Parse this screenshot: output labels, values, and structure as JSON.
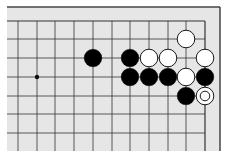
{
  "board": {
    "background": "#e6e6e6",
    "line_color": "#333333",
    "x_lines": [
      18,
      37,
      55,
      74,
      93,
      112,
      130,
      149,
      168,
      186,
      205
    ],
    "y_lines": [
      21,
      39,
      58,
      77,
      96,
      114,
      133
    ],
    "edge_right": true,
    "edge_top": true,
    "star_points": [
      [
        1,
        3
      ]
    ],
    "stones": [
      {
        "col": 9,
        "row": 1,
        "color": "white"
      },
      {
        "col": 4,
        "row": 2,
        "color": "black"
      },
      {
        "col": 6,
        "row": 2,
        "color": "black"
      },
      {
        "col": 7,
        "row": 2,
        "color": "white"
      },
      {
        "col": 8,
        "row": 2,
        "color": "white"
      },
      {
        "col": 10,
        "row": 2,
        "color": "white"
      },
      {
        "col": 6,
        "row": 3,
        "color": "black"
      },
      {
        "col": 7,
        "row": 3,
        "color": "black"
      },
      {
        "col": 8,
        "row": 3,
        "color": "black"
      },
      {
        "col": 9,
        "row": 3,
        "color": "white"
      },
      {
        "col": 10,
        "row": 3,
        "color": "black"
      },
      {
        "col": 9,
        "row": 4,
        "color": "black"
      },
      {
        "col": 10,
        "row": 4,
        "color": "white",
        "marked": true
      }
    ]
  }
}
